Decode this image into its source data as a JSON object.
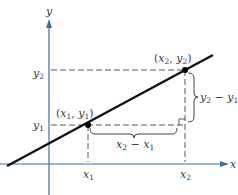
{
  "figure": {
    "type": "slope-of-line-diagram",
    "axes": {
      "x_label": "x",
      "y_label": "y",
      "axis_color": "#3d6fa3"
    },
    "line_color": "#111111",
    "dash_color": "#555555",
    "points": [
      {
        "name": "P1",
        "label_open": "(",
        "label_x": "x",
        "label_x_sub": "1",
        "label_sep": ", ",
        "label_y": "y",
        "label_y_sub": "1",
        "label_close": ")"
      },
      {
        "name": "P2",
        "label_open": "(",
        "label_x": "x",
        "label_x_sub": "2",
        "label_sep": ", ",
        "label_y": "y",
        "label_y_sub": "2",
        "label_close": ")"
      }
    ],
    "ticks": {
      "x1": {
        "var": "x",
        "sub": "1"
      },
      "x2": {
        "var": "x",
        "sub": "2"
      },
      "y1": {
        "var": "y",
        "sub": "1"
      },
      "y2": {
        "var": "y",
        "sub": "2"
      }
    },
    "rise_label": {
      "a": "y",
      "a_sub": "2",
      "op": " − ",
      "b": "y",
      "b_sub": "1"
    },
    "run_label": {
      "a": "x",
      "a_sub": "2",
      "op": " − ",
      "b": "x",
      "b_sub": "1"
    }
  }
}
